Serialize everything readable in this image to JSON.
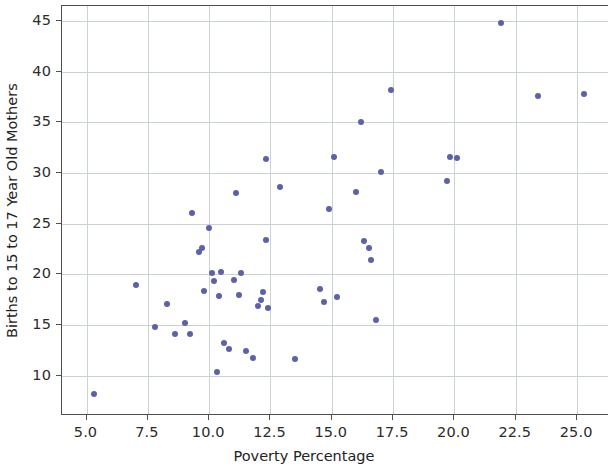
{
  "chart_data": {
    "type": "scatter",
    "title": "",
    "xlabel": "Poverty Percentage",
    "ylabel": "Births to 15 to 17 Year Old Mothers",
    "xlim": [
      4.0,
      26.3
    ],
    "ylim": [
      6.0,
      46.5
    ],
    "xticks": [
      5.0,
      7.5,
      10.0,
      12.5,
      15.0,
      17.5,
      20.0,
      22.5,
      25.0
    ],
    "xticklabels": [
      "5.0",
      "7.5",
      "10.0",
      "12.5",
      "15.0",
      "17.5",
      "20.0",
      "22.5",
      "25.0"
    ],
    "yticks": [
      10,
      15,
      20,
      25,
      30,
      35,
      40,
      45
    ],
    "yticklabels": [
      "10",
      "15",
      "20",
      "25",
      "30",
      "35",
      "40",
      "45"
    ],
    "grid": true,
    "grid_color": "#c9d3d6",
    "marker_color": "#5d61a8",
    "marker_size": 6,
    "legend": null,
    "n_points": 51,
    "points": [
      {
        "x": 5.3,
        "y": 8.2
      },
      {
        "x": 7.0,
        "y": 18.9
      },
      {
        "x": 7.8,
        "y": 14.8
      },
      {
        "x": 8.3,
        "y": 17.1
      },
      {
        "x": 8.6,
        "y": 14.1
      },
      {
        "x": 9.0,
        "y": 15.2
      },
      {
        "x": 9.2,
        "y": 14.1
      },
      {
        "x": 9.3,
        "y": 26.1
      },
      {
        "x": 9.6,
        "y": 22.2
      },
      {
        "x": 9.7,
        "y": 22.6
      },
      {
        "x": 9.8,
        "y": 18.3
      },
      {
        "x": 10.0,
        "y": 24.6
      },
      {
        "x": 10.1,
        "y": 20.1
      },
      {
        "x": 10.2,
        "y": 19.3
      },
      {
        "x": 10.3,
        "y": 10.3
      },
      {
        "x": 10.4,
        "y": 17.9
      },
      {
        "x": 10.5,
        "y": 20.2
      },
      {
        "x": 10.6,
        "y": 13.2
      },
      {
        "x": 10.8,
        "y": 12.6
      },
      {
        "x": 11.0,
        "y": 19.4
      },
      {
        "x": 11.1,
        "y": 28.0
      },
      {
        "x": 11.2,
        "y": 18.0
      },
      {
        "x": 11.3,
        "y": 20.1
      },
      {
        "x": 11.5,
        "y": 12.4
      },
      {
        "x": 11.8,
        "y": 11.7
      },
      {
        "x": 12.0,
        "y": 16.9
      },
      {
        "x": 12.1,
        "y": 17.5
      },
      {
        "x": 12.2,
        "y": 18.2
      },
      {
        "x": 12.3,
        "y": 31.4
      },
      {
        "x": 12.3,
        "y": 23.4
      },
      {
        "x": 12.4,
        "y": 16.7
      },
      {
        "x": 12.9,
        "y": 28.6
      },
      {
        "x": 13.5,
        "y": 11.6
      },
      {
        "x": 14.5,
        "y": 18.5
      },
      {
        "x": 14.7,
        "y": 17.3
      },
      {
        "x": 14.9,
        "y": 26.4
      },
      {
        "x": 15.1,
        "y": 31.6
      },
      {
        "x": 15.2,
        "y": 17.8
      },
      {
        "x": 16.0,
        "y": 28.1
      },
      {
        "x": 16.2,
        "y": 35.0
      },
      {
        "x": 16.3,
        "y": 23.3
      },
      {
        "x": 16.5,
        "y": 22.6
      },
      {
        "x": 16.6,
        "y": 21.4
      },
      {
        "x": 16.8,
        "y": 15.5
      },
      {
        "x": 17.0,
        "y": 30.1
      },
      {
        "x": 17.4,
        "y": 38.2
      },
      {
        "x": 19.7,
        "y": 29.2
      },
      {
        "x": 19.8,
        "y": 31.6
      },
      {
        "x": 20.1,
        "y": 31.5
      },
      {
        "x": 21.9,
        "y": 44.8
      },
      {
        "x": 23.4,
        "y": 37.6
      },
      {
        "x": 25.3,
        "y": 37.8
      }
    ]
  }
}
